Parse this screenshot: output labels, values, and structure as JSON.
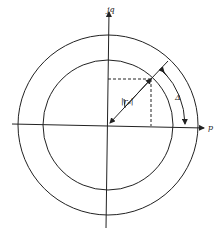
{
  "diagram": {
    "axis_labels": {
      "vertical": "jq",
      "horizontal": "p"
    },
    "vector_label": "|r_p|",
    "vector_label_display": "|rₚ|",
    "angle_label": "Δ",
    "stroke_color": "#222222",
    "background": "#ffffff"
  }
}
